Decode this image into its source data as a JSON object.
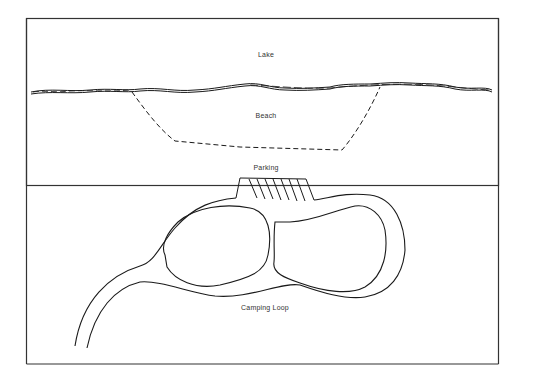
{
  "diagram": {
    "type": "site-plan",
    "labels": {
      "lake": "Lake",
      "beach": "Beach",
      "parking": "Parking",
      "camping_loop": "Camping Loop"
    },
    "colors": {
      "line": "#1a1a1a",
      "border": "#333333",
      "background": "#ffffff",
      "text": "#333333"
    }
  }
}
